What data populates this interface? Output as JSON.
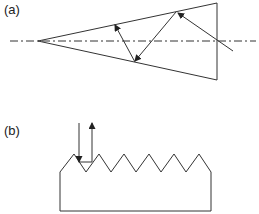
{
  "panels": [
    {
      "label": "(a)",
      "description": "Cone with dash-dot axis and ray bouncing toward apex"
    },
    {
      "label": "(b)",
      "description": "Sawtooth surface with incident and reflected rays"
    }
  ],
  "colors": {
    "line": "#333333",
    "background": "#ffffff"
  }
}
